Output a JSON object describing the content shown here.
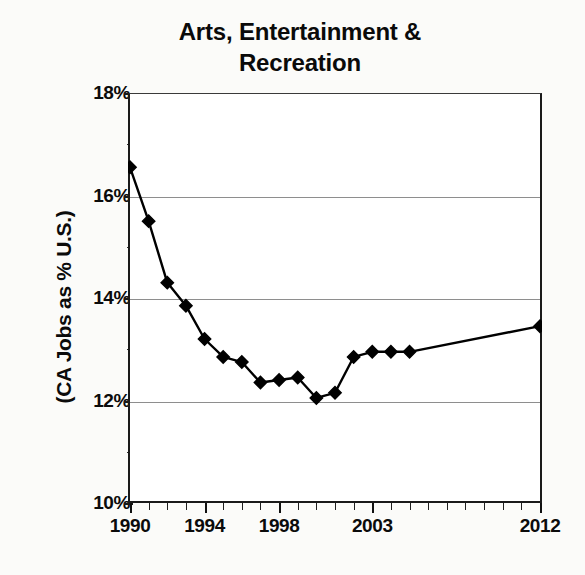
{
  "chart_data": {
    "type": "line",
    "title": "Arts, Entertainment & Recreation",
    "title_line1": "Arts, Entertainment &",
    "title_line2": "Recreation",
    "xlabel": "",
    "ylabel": "(CA Jobs as % U.S.)",
    "ylim": [
      10,
      18
    ],
    "xlim": [
      1990,
      2012
    ],
    "y_ticks": [
      10,
      12,
      14,
      16,
      18
    ],
    "y_tick_labels": [
      "10%",
      "12%",
      "14%",
      "16%",
      "18%"
    ],
    "x_tick_values": [
      1990,
      1991,
      1992,
      1993,
      1994,
      1995,
      1996,
      1997,
      1998,
      1999,
      2000,
      2001,
      2002,
      2003,
      2004,
      2005,
      2006,
      2007,
      2008,
      2009,
      2010,
      2011,
      2012
    ],
    "x_tick_labels_shown": [
      "1990",
      "1994",
      "1998",
      "2003",
      "2012"
    ],
    "x_labeled_values": [
      1990,
      1994,
      1998,
      2003,
      2012
    ],
    "grid": "horizontal",
    "legend": "none",
    "marker": "diamond",
    "line_color": "#000000",
    "marker_color": "#000000",
    "background": "#ffffff",
    "series": [
      {
        "name": "CA Jobs as % U.S. - Arts, Entertainment & Recreation",
        "x": [
          1990,
          1991,
          1992,
          1993,
          1994,
          1995,
          1996,
          1997,
          1998,
          1999,
          2000,
          2001,
          2002,
          2003,
          2004,
          2005,
          2012
        ],
        "values": [
          16.55,
          15.5,
          14.3,
          13.85,
          13.2,
          12.85,
          12.75,
          12.35,
          12.4,
          12.45,
          12.05,
          12.15,
          12.85,
          12.95,
          12.95,
          12.95,
          13.45
        ]
      }
    ]
  },
  "axes": {
    "y_label": "(CA Jobs as % U.S.)",
    "y_ticks": [
      {
        "label": "18%",
        "value": 18
      },
      {
        "label": "16%",
        "value": 16
      },
      {
        "label": "14%",
        "value": 14
      },
      {
        "label": "12%",
        "value": 12
      },
      {
        "label": "10%",
        "value": 10
      }
    ],
    "x_ticks": [
      {
        "label": "1990",
        "value": 1990
      },
      {
        "label": "1994",
        "value": 1994
      },
      {
        "label": "1998",
        "value": 1998
      },
      {
        "label": "2003",
        "value": 2003
      },
      {
        "label": "2012",
        "value": 2012
      }
    ]
  }
}
